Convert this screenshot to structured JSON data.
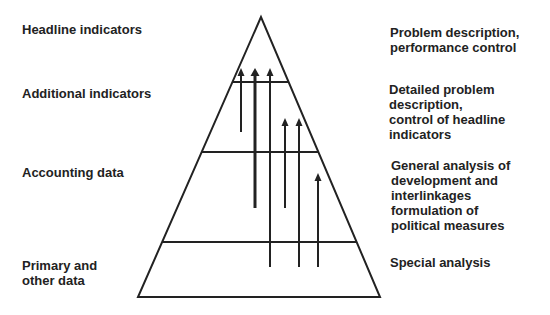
{
  "left_labels": [
    {
      "text": "Headline indicators",
      "x": 22,
      "y": 22
    },
    {
      "text": "Additional indicators",
      "x": 22,
      "y": 86
    },
    {
      "text": "Accounting data",
      "x": 22,
      "y": 165
    },
    {
      "text": "Primary and\nother data",
      "x": 22,
      "y": 258
    }
  ],
  "right_labels": [
    {
      "text": "Problem description,\nperformance control",
      "x": 390,
      "y": 25
    },
    {
      "text": "Detailed problem\ndescription,\ncontrol of headline\nindicators",
      "x": 389,
      "y": 82
    },
    {
      "text": "General analysis of\ndevelopment and\ninterlinkages\nformulation of\npolitical measures",
      "x": 391,
      "y": 158
    },
    {
      "text": "Special analysis",
      "x": 390,
      "y": 255
    }
  ],
  "pyramid": {
    "apex": [
      261,
      17
    ],
    "base_left": [
      138,
      297
    ],
    "base_right": [
      380,
      297
    ],
    "level_lines_y": [
      82,
      152,
      242
    ],
    "stroke_color": "#222222"
  },
  "arrows": [
    {
      "x": 241,
      "top": 68,
      "bottom": 132,
      "width": 2
    },
    {
      "x": 255,
      "top": 68,
      "bottom": 208,
      "width": 3
    },
    {
      "x": 270,
      "top": 68,
      "bottom": 267,
      "width": 2
    },
    {
      "x": 285,
      "top": 118,
      "bottom": 208,
      "width": 2
    },
    {
      "x": 299,
      "top": 118,
      "bottom": 267,
      "width": 2
    },
    {
      "x": 318,
      "top": 173,
      "bottom": 267,
      "width": 2
    }
  ]
}
